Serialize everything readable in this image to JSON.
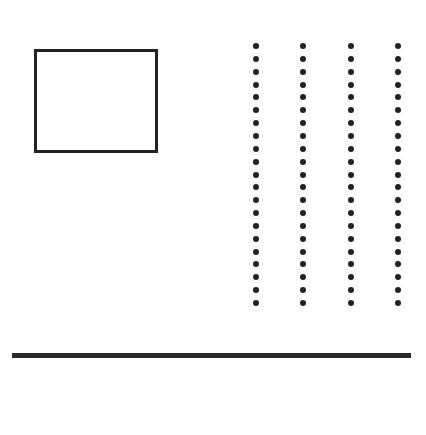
{
  "canvas": {
    "width": 426,
    "height": 435,
    "background": "#ffffff"
  },
  "shapes": {
    "rectangle": {
      "left": 34,
      "top": 49,
      "width": 124,
      "height": 104,
      "border_width": 3,
      "color": "#222222"
    },
    "dot_grid": {
      "columns_x": [
        256,
        303,
        351,
        398
      ],
      "first_y": 46,
      "spacing": 12.85,
      "count_per_column": 21,
      "dot_diameter": 6,
      "color": "#222222"
    },
    "horizontal_line": {
      "left": 12,
      "top": 353,
      "width": 399,
      "thickness": 5,
      "color": "#2a2a2a"
    }
  }
}
